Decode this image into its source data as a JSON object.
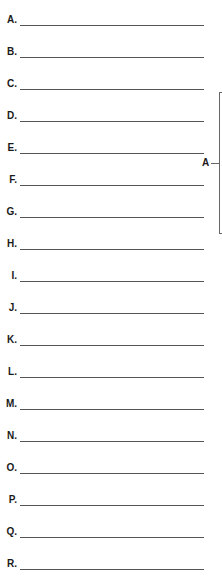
{
  "worksheet": {
    "rows": [
      {
        "label": "A.",
        "value": ""
      },
      {
        "label": "B.",
        "value": ""
      },
      {
        "label": "C.",
        "value": ""
      },
      {
        "label": "D.",
        "value": ""
      },
      {
        "label": "E.",
        "value": ""
      },
      {
        "label": "F.",
        "value": ""
      },
      {
        "label": "G.",
        "value": ""
      },
      {
        "label": "H.",
        "value": ""
      },
      {
        "label": "I.",
        "value": ""
      },
      {
        "label": "J.",
        "value": ""
      },
      {
        "label": "K.",
        "value": ""
      },
      {
        "label": "L.",
        "value": ""
      },
      {
        "label": "M.",
        "value": ""
      },
      {
        "label": "N.",
        "value": ""
      },
      {
        "label": "O.",
        "value": ""
      },
      {
        "label": "P.",
        "value": ""
      },
      {
        "label": "Q.",
        "value": ""
      },
      {
        "label": "R.",
        "value": ""
      }
    ],
    "bracket": {
      "label": "A"
    }
  }
}
